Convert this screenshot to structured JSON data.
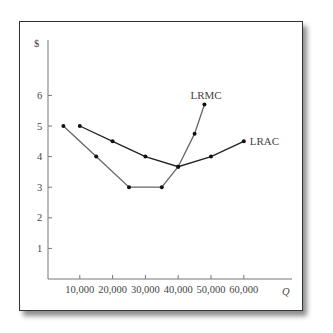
{
  "chart_data": {
    "type": "line",
    "title": "",
    "xlabel": "Q",
    "ylabel": "$",
    "xlim": [
      0,
      70000
    ],
    "ylim": [
      0,
      7
    ],
    "grid": false,
    "x_ticks": [
      10000,
      20000,
      30000,
      40000,
      50000,
      60000
    ],
    "x_tick_labels": [
      "10,000",
      "20,000",
      "30,000",
      "40,000",
      "50,000",
      "60,000"
    ],
    "y_ticks": [
      1,
      2,
      3,
      4,
      5,
      6
    ],
    "y_tick_labels": [
      "1",
      "2",
      "3",
      "4",
      "5",
      "6"
    ],
    "series": [
      {
        "name": "LRAC",
        "color": "#222222",
        "x": [
          10000,
          20000,
          30000,
          40000,
          50000,
          60000
        ],
        "values": [
          5,
          4.5,
          4,
          3.67,
          4,
          4.5
        ]
      },
      {
        "name": "LRMC",
        "color": "#666666",
        "x": [
          5000,
          15000,
          25000,
          35000,
          40000,
          45000,
          48000
        ],
        "values": [
          5,
          4,
          3,
          3,
          3.67,
          4.75,
          5.7
        ]
      }
    ],
    "annotations": [
      {
        "text": "LRMC",
        "at": "end of LRMC curve, above"
      },
      {
        "text": "LRAC",
        "at": "end of LRAC curve, right"
      }
    ]
  }
}
